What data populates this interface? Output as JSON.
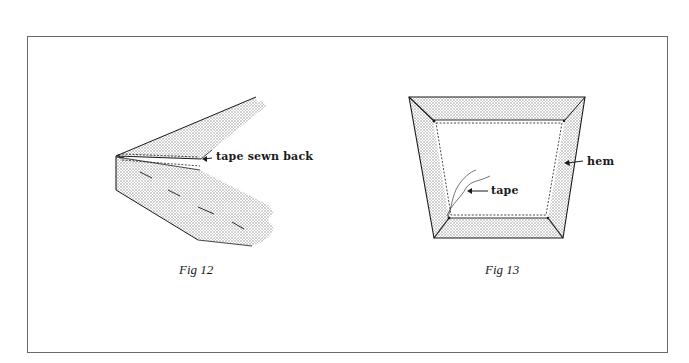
{
  "figures": [
    {
      "id": "fig12",
      "caption": "Fig 12",
      "labels": [
        {
          "text": "tape sewn back"
        }
      ]
    },
    {
      "id": "fig13",
      "caption": "Fig 13",
      "labels": [
        {
          "text": "hem"
        },
        {
          "text": "tape"
        }
      ]
    }
  ],
  "colors": {
    "ink": "#1a1a1a",
    "frame": "#6a6a6a",
    "stipple": "#b8b8b8",
    "background": "#ffffff"
  }
}
